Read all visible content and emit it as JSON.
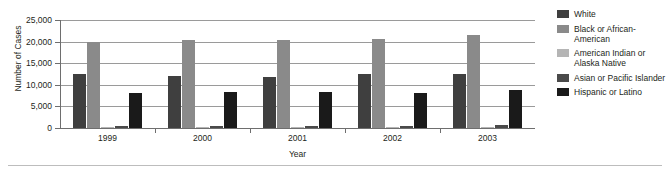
{
  "chart_data": {
    "type": "bar",
    "title": "",
    "subtitle": "",
    "xlabel": "Year",
    "ylabel": "Number of Cases",
    "categories": [
      "1999",
      "2000",
      "2001",
      "2002",
      "2003"
    ],
    "ylim": [
      0,
      25000
    ],
    "ytick_labels": [
      "25,000",
      "20,000",
      "15,000",
      "10,000",
      "5,000",
      "0"
    ],
    "ytick_values": [
      25000,
      20000,
      15000,
      10000,
      5000,
      0
    ],
    "grid": true,
    "legend_position": "right",
    "series": [
      {
        "name": "White",
        "color": "#3f3f3f",
        "values": [
          12600,
          12100,
          11800,
          12400,
          12500
        ]
      },
      {
        "name": "Black or African-American",
        "color": "#8a8a8a",
        "values": [
          20000,
          20300,
          20400,
          20600,
          21500
        ]
      },
      {
        "name": "American Indian or Alaska Native",
        "color": "#b5b5b5",
        "values": [
          200,
          200,
          200,
          200,
          250
        ]
      },
      {
        "name": "Asian or Pacific Islander",
        "color": "#4a4a4a",
        "values": [
          500,
          550,
          550,
          550,
          600
        ]
      },
      {
        "name": "Hispanic or Latino",
        "color": "#1a1a1a",
        "values": [
          8100,
          8400,
          8400,
          8200,
          8800
        ]
      }
    ]
  },
  "legend": {
    "items": [
      {
        "label": "White",
        "color": "#3f3f3f"
      },
      {
        "label": "Black or African-American",
        "color": "#8a8a8a"
      },
      {
        "label": "American Indian or Alaska Native",
        "color": "#b5b5b5"
      },
      {
        "label": "Asian or Pacific Islander",
        "color": "#4a4a4a"
      },
      {
        "label": "Hispanic or Latino",
        "color": "#1a1a1a"
      }
    ]
  },
  "axes": {
    "y_title": "Number of Cases",
    "x_title": "Year"
  }
}
